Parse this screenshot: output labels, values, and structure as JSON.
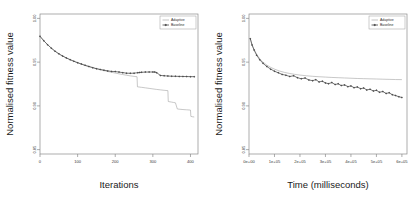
{
  "figure": {
    "background": "#ffffff",
    "panel_count": 2
  },
  "colors": {
    "adaptive": "#9a9a9a",
    "baseline": "#4a4a4a",
    "axis": "#8a8a8a",
    "text": "#1a1a1a"
  },
  "chart_data": [
    {
      "type": "line",
      "panel": "left",
      "title": "",
      "xlabel": "Iterations",
      "ylabel": "Normalised fitness value",
      "xlim": [
        0,
        420
      ],
      "ylim": [
        0.845,
        1.005
      ],
      "xticks": [
        0,
        100,
        200,
        300,
        400
      ],
      "xticklabels": [
        "0",
        "100",
        "200",
        "300",
        "400"
      ],
      "yticks": [
        0.85,
        0.9,
        0.95,
        1.0
      ],
      "yticklabels": [
        "0.85",
        "0.90",
        "0.95",
        "1.00"
      ],
      "grid": false,
      "legend_position": "top-right",
      "series": [
        {
          "name": "Adaptive",
          "marker": "none",
          "color": "#9a9a9a",
          "x": [
            0,
            10,
            20,
            30,
            40,
            50,
            60,
            70,
            80,
            90,
            100,
            110,
            120,
            130,
            140,
            150,
            160,
            170,
            180,
            190,
            200,
            210,
            220,
            230,
            240,
            250,
            258,
            259,
            270,
            280,
            290,
            300,
            310,
            320,
            330,
            340,
            341,
            350,
            355,
            360,
            365,
            370,
            380,
            390,
            400,
            401,
            405,
            410
          ],
          "y": [
            0.9795,
            0.9745,
            0.97,
            0.966,
            0.9625,
            0.9595,
            0.957,
            0.9548,
            0.9528,
            0.951,
            0.9493,
            0.9478,
            0.9463,
            0.945,
            0.9437,
            0.9425,
            0.9414,
            0.9403,
            0.9393,
            0.9384,
            0.9375,
            0.9366,
            0.9358,
            0.935,
            0.9343,
            0.9337,
            0.9333,
            0.9218,
            0.9212,
            0.9206,
            0.92,
            0.9194,
            0.9188,
            0.9183,
            0.9178,
            0.9174,
            0.905,
            0.9043,
            0.9039,
            0.9035,
            0.8965,
            0.8962,
            0.8958,
            0.8955,
            0.8952,
            0.888,
            0.8876,
            0.8873
          ]
        },
        {
          "name": "Baseline",
          "marker": "diamond",
          "color": "#4a4a4a",
          "x": [
            0,
            10,
            20,
            30,
            40,
            50,
            60,
            70,
            80,
            90,
            100,
            110,
            120,
            130,
            140,
            150,
            160,
            170,
            180,
            190,
            200,
            210,
            220,
            230,
            240,
            250,
            260,
            265,
            270,
            280,
            290,
            300,
            305,
            310,
            320,
            330,
            340,
            350,
            360,
            370,
            380,
            390,
            400,
            410
          ],
          "y": [
            0.9795,
            0.9745,
            0.97,
            0.966,
            0.9625,
            0.9595,
            0.957,
            0.9548,
            0.9528,
            0.951,
            0.9493,
            0.9478,
            0.9463,
            0.945,
            0.9437,
            0.9425,
            0.9416,
            0.9408,
            0.94,
            0.9394,
            0.9392,
            0.9386,
            0.938,
            0.9374,
            0.9372,
            0.9374,
            0.9379,
            0.9382,
            0.9384,
            0.9386,
            0.9387,
            0.9387,
            0.9386,
            0.938,
            0.9348,
            0.9344,
            0.9341,
            0.9339,
            0.9338,
            0.9337,
            0.9336,
            0.9335,
            0.9334,
            0.9334
          ]
        }
      ]
    },
    {
      "type": "line",
      "panel": "right",
      "title": "",
      "xlabel": "Time (milliseconds)",
      "ylabel": "Normalised fitness value",
      "xlim": [
        0,
        620000
      ],
      "ylim": [
        0.845,
        1.005
      ],
      "xticks": [
        0,
        100000,
        200000,
        300000,
        400000,
        500000,
        600000
      ],
      "xticklabels": [
        "0e+00",
        "1e+05",
        "2e+05",
        "3e+05",
        "4e+05",
        "5e+05",
        "6e+05"
      ],
      "yticks": [
        0.85,
        0.9,
        0.95,
        1.0
      ],
      "yticklabels": [
        "0.85",
        "0.90",
        "0.95",
        "1.00"
      ],
      "grid": false,
      "legend_position": "top-right",
      "series": [
        {
          "name": "Adaptive",
          "marker": "none",
          "color": "#9a9a9a",
          "x": [
            5000,
            12000,
            20000,
            30000,
            42000,
            55000,
            70000,
            85000,
            100000,
            120000,
            140000,
            160000,
            180000,
            200000,
            225000,
            250000,
            275000,
            300000,
            325000,
            350000,
            375000,
            400000,
            425000,
            450000,
            475000,
            500000,
            525000,
            550000,
            575000,
            600000
          ],
          "y": [
            0.977,
            0.97,
            0.9645,
            0.959,
            0.954,
            0.95,
            0.9466,
            0.944,
            0.942,
            0.9398,
            0.9382,
            0.937,
            0.936,
            0.9352,
            0.9344,
            0.9338,
            0.9333,
            0.9329,
            0.9325,
            0.9322,
            0.9319,
            0.9316,
            0.9313,
            0.9311,
            0.9309,
            0.9307,
            0.9305,
            0.9303,
            0.9301,
            0.93
          ]
        },
        {
          "name": "Baseline",
          "marker": "diamond",
          "color": "#4a4a4a",
          "x": [
            5000,
            12000,
            20000,
            30000,
            42000,
            55000,
            70000,
            85000,
            100000,
            115000,
            130000,
            145000,
            160000,
            175000,
            190000,
            205000,
            220000,
            235000,
            250000,
            262000,
            275000,
            288000,
            300000,
            312000,
            325000,
            338000,
            350000,
            362000,
            375000,
            388000,
            400000,
            412000,
            425000,
            438000,
            450000,
            462000,
            475000,
            488000,
            500000,
            512000,
            525000,
            538000,
            550000,
            562000,
            575000,
            588000,
            600000
          ],
          "y": [
            0.9768,
            0.9695,
            0.9638,
            0.958,
            0.9528,
            0.9486,
            0.945,
            0.942,
            0.9396,
            0.9378,
            0.936,
            0.935,
            0.9336,
            0.9344,
            0.9322,
            0.931,
            0.9318,
            0.9296,
            0.9288,
            0.93,
            0.9274,
            0.9282,
            0.9262,
            0.9254,
            0.9266,
            0.9244,
            0.9252,
            0.9232,
            0.924,
            0.922,
            0.9228,
            0.9208,
            0.9216,
            0.9196,
            0.9204,
            0.9182,
            0.919,
            0.917,
            0.9178,
            0.9156,
            0.9164,
            0.9142,
            0.915,
            0.9128,
            0.9118,
            0.9104,
            0.9096
          ]
        }
      ]
    }
  ]
}
